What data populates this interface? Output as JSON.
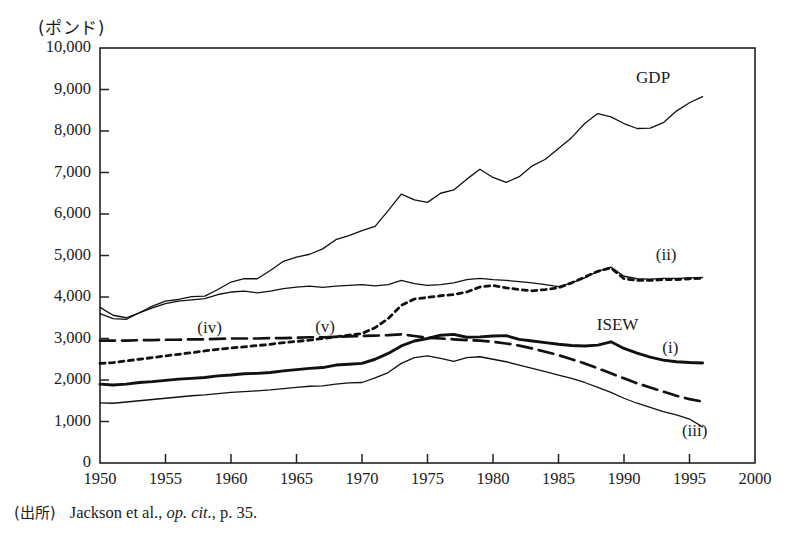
{
  "figure": {
    "unit_label": "(ポンド)",
    "source_prefix": "(出所)",
    "source_author": "Jackson et al.,",
    "source_italic": "op. cit.",
    "source_tail": ", p. 35."
  },
  "chart_data": {
    "type": "line",
    "title": "",
    "xlabel": "",
    "ylabel": "(ポンド)",
    "xlim": [
      1950,
      2000
    ],
    "ylim": [
      0,
      10000
    ],
    "xticks": [
      1950,
      1955,
      1960,
      1965,
      1970,
      1975,
      1980,
      1985,
      1990,
      1995,
      2000
    ],
    "yticks": [
      0,
      1000,
      2000,
      3000,
      4000,
      5000,
      6000,
      7000,
      8000,
      9000,
      10000
    ],
    "ytick_labels": [
      "0",
      "1,000",
      "2,000",
      "3,000",
      "4,000",
      "5,000",
      "6,000",
      "7,000",
      "8,000",
      "9,000",
      "10,000"
    ],
    "xtick_labels": [
      "1950",
      "1955",
      "1960",
      "1965",
      "1970",
      "1975",
      "1980",
      "1985",
      "1990",
      "1995",
      "2000"
    ],
    "grid": false,
    "legend": "inline-annotations",
    "annotations": [
      {
        "text": "GDP",
        "x": 1991.0,
        "y": 9250
      },
      {
        "text": "(ii)",
        "x": 1992.5,
        "y": 5000
      },
      {
        "text": "ISEW",
        "x": 1988.0,
        "y": 3300
      },
      {
        "text": "(i)",
        "x": 1993.0,
        "y": 2750
      },
      {
        "text": "(iii)",
        "x": 1994.5,
        "y": 750
      },
      {
        "text": "(iv)",
        "x": 1957.5,
        "y": 3220
      },
      {
        "text": "(v)",
        "x": 1966.5,
        "y": 3250
      }
    ],
    "series": [
      {
        "name": "GDP",
        "style": "thin-solid",
        "x": [
          1950,
          1951,
          1952,
          1953,
          1954,
          1955,
          1956,
          1957,
          1958,
          1959,
          1960,
          1961,
          1962,
          1963,
          1964,
          1965,
          1966,
          1967,
          1968,
          1969,
          1970,
          1971,
          1972,
          1973,
          1974,
          1975,
          1976,
          1977,
          1978,
          1979,
          1980,
          1981,
          1982,
          1983,
          1984,
          1985,
          1986,
          1987,
          1988,
          1989,
          1990,
          1991,
          1992,
          1993,
          1994,
          1995,
          1996
        ],
        "values": [
          3600,
          3480,
          3460,
          3620,
          3780,
          3900,
          3940,
          4010,
          4020,
          4180,
          4360,
          4440,
          4440,
          4640,
          4860,
          4960,
          5030,
          5160,
          5380,
          5480,
          5600,
          5700,
          6080,
          6480,
          6340,
          6280,
          6500,
          6580,
          6840,
          7080,
          6880,
          6760,
          6900,
          7160,
          7320,
          7580,
          7840,
          8180,
          8420,
          8340,
          8180,
          8060,
          8070,
          8200,
          8480,
          8680,
          8830
        ]
      },
      {
        "name": "(ii)",
        "style": "thin-solid",
        "x": [
          1950,
          1951,
          1952,
          1953,
          1954,
          1955,
          1956,
          1957,
          1958,
          1959,
          1960,
          1961,
          1962,
          1963,
          1964,
          1965,
          1966,
          1967,
          1968,
          1969,
          1970,
          1971,
          1972,
          1973,
          1974,
          1975,
          1976,
          1977,
          1978,
          1979,
          1980,
          1981,
          1982,
          1983,
          1984,
          1985,
          1986,
          1987,
          1988,
          1989,
          1990,
          1991,
          1992,
          1993,
          1994,
          1995,
          1996
        ],
        "values": [
          3750,
          3560,
          3500,
          3620,
          3740,
          3840,
          3900,
          3930,
          3960,
          4060,
          4120,
          4140,
          4100,
          4140,
          4200,
          4240,
          4260,
          4230,
          4260,
          4280,
          4300,
          4270,
          4300,
          4400,
          4320,
          4280,
          4300,
          4340,
          4420,
          4450,
          4420,
          4400,
          4370,
          4340,
          4300,
          4250,
          4340,
          4460,
          4620,
          4720,
          4500,
          4440,
          4430,
          4450,
          4450,
          4460,
          4470
        ]
      },
      {
        "name": "(v)",
        "style": "dotted",
        "x": [
          1950,
          1951,
          1952,
          1953,
          1954,
          1955,
          1956,
          1957,
          1958,
          1959,
          1960,
          1961,
          1962,
          1963,
          1964,
          1965,
          1966,
          1967,
          1968,
          1969,
          1970,
          1971,
          1972,
          1973,
          1974,
          1975,
          1976,
          1977,
          1978,
          1979,
          1980,
          1981,
          1982,
          1983,
          1984,
          1985,
          1986,
          1987,
          1988,
          1989,
          1990,
          1991,
          1992,
          1993,
          1994,
          1995,
          1996
        ],
        "values": [
          2400,
          2420,
          2460,
          2500,
          2540,
          2580,
          2620,
          2660,
          2700,
          2740,
          2770,
          2800,
          2830,
          2860,
          2900,
          2930,
          2960,
          3000,
          3040,
          3080,
          3120,
          3260,
          3480,
          3800,
          3950,
          3990,
          4030,
          4060,
          4120,
          4240,
          4280,
          4220,
          4180,
          4150,
          4180,
          4220,
          4340,
          4480,
          4620,
          4700,
          4440,
          4400,
          4400,
          4420,
          4420,
          4440,
          4450
        ]
      },
      {
        "name": "(iv)",
        "style": "dashed",
        "x": [
          1950,
          1951,
          1952,
          1953,
          1954,
          1955,
          1956,
          1957,
          1958,
          1959,
          1960,
          1961,
          1962,
          1963,
          1964,
          1965,
          1966,
          1967,
          1968,
          1969,
          1970,
          1971,
          1972,
          1973,
          1974,
          1975,
          1976,
          1977,
          1978,
          1979,
          1980,
          1981,
          1982,
          1983,
          1984,
          1985,
          1986,
          1987,
          1988,
          1989,
          1990,
          1991,
          1992,
          1993,
          1994,
          1995,
          1996
        ],
        "values": [
          2950,
          2950,
          2950,
          2960,
          2960,
          2970,
          2970,
          2980,
          2980,
          2990,
          3000,
          3000,
          3000,
          3010,
          3010,
          3020,
          3030,
          3030,
          3040,
          3050,
          3060,
          3070,
          3080,
          3100,
          3060,
          3020,
          3000,
          2980,
          2960,
          2950,
          2920,
          2880,
          2830,
          2760,
          2680,
          2600,
          2500,
          2400,
          2280,
          2160,
          2040,
          1920,
          1820,
          1720,
          1620,
          1540,
          1480
        ]
      },
      {
        "name": "(i)",
        "style": "thick-solid",
        "x": [
          1950,
          1951,
          1952,
          1953,
          1954,
          1955,
          1956,
          1957,
          1958,
          1959,
          1960,
          1961,
          1962,
          1963,
          1964,
          1965,
          1966,
          1967,
          1968,
          1969,
          1970,
          1971,
          1972,
          1973,
          1974,
          1975,
          1976,
          1977,
          1978,
          1979,
          1980,
          1981,
          1982,
          1983,
          1984,
          1985,
          1986,
          1987,
          1988,
          1989,
          1990,
          1991,
          1992,
          1993,
          1994,
          1995,
          1996
        ],
        "values": [
          1900,
          1880,
          1900,
          1940,
          1960,
          1990,
          2020,
          2040,
          2060,
          2100,
          2120,
          2150,
          2160,
          2180,
          2220,
          2250,
          2280,
          2300,
          2360,
          2380,
          2400,
          2500,
          2640,
          2820,
          2940,
          3000,
          3080,
          3100,
          3030,
          3040,
          3060,
          3070,
          2980,
          2940,
          2900,
          2860,
          2830,
          2820,
          2840,
          2920,
          2760,
          2650,
          2550,
          2480,
          2440,
          2420,
          2410
        ]
      },
      {
        "name": "(iii)",
        "style": "thin-solid",
        "x": [
          1950,
          1951,
          1952,
          1953,
          1954,
          1955,
          1956,
          1957,
          1958,
          1959,
          1960,
          1961,
          1962,
          1963,
          1964,
          1965,
          1966,
          1967,
          1968,
          1969,
          1970,
          1971,
          1972,
          1973,
          1974,
          1975,
          1976,
          1977,
          1978,
          1979,
          1980,
          1981,
          1982,
          1983,
          1984,
          1985,
          1986,
          1987,
          1988,
          1989,
          1990,
          1991,
          1992,
          1993,
          1994,
          1995,
          1996
        ],
        "values": [
          1450,
          1440,
          1470,
          1500,
          1530,
          1560,
          1590,
          1620,
          1640,
          1670,
          1700,
          1720,
          1740,
          1760,
          1790,
          1820,
          1850,
          1860,
          1900,
          1930,
          1940,
          2050,
          2180,
          2400,
          2540,
          2580,
          2520,
          2450,
          2540,
          2560,
          2500,
          2440,
          2360,
          2280,
          2200,
          2120,
          2040,
          1940,
          1820,
          1700,
          1560,
          1440,
          1340,
          1240,
          1160,
          1060,
          870
        ]
      }
    ]
  }
}
